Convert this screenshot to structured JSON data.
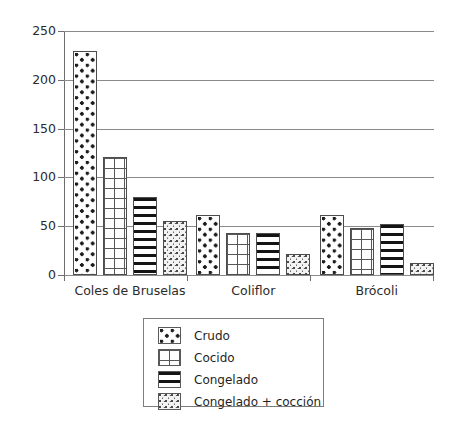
{
  "chart_data": {
    "type": "bar",
    "title": "",
    "xlabel": "",
    "ylabel": "",
    "ylim": [
      0,
      250
    ],
    "yticks": [
      0,
      50,
      100,
      150,
      200,
      250
    ],
    "ytick_labels": [
      "0",
      "50",
      "100",
      "150",
      "200",
      "250"
    ],
    "grid": true,
    "legend_position": "bottom-center",
    "categories": [
      "Coles de Bruselas",
      "Coliflor",
      "Brócoli"
    ],
    "series": [
      {
        "name": "Crudo",
        "values": [
          230,
          62,
          61
        ]
      },
      {
        "name": "Cocido",
        "values": [
          121,
          43,
          48
        ]
      },
      {
        "name": "Congelado",
        "values": [
          80,
          43,
          52
        ]
      },
      {
        "name": "Congelado + cocción",
        "values": [
          55,
          22,
          12
        ]
      }
    ],
    "series_patterns": [
      "dotted-fill",
      "grid-fill",
      "horizontal-lines-fill",
      "speckled-fill"
    ]
  },
  "legend": {
    "items": [
      {
        "label": "Crudo"
      },
      {
        "label": "Cocido"
      },
      {
        "label": "Congelado"
      },
      {
        "label": "Congelado + cocción"
      }
    ]
  },
  "colors": {
    "axis": "#6f6f6f",
    "grid": "#8a8a8a",
    "bar_outline": "#4d4d4d",
    "text": "#1f1f1f",
    "background": "#ffffff"
  }
}
